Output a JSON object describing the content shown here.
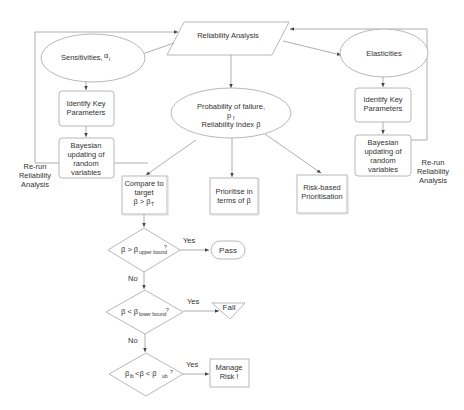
{
  "diagram": {
    "title_node": "Reliability Analysis",
    "left_branch": {
      "sensitivities": "Sensitivities,",
      "sensitivities_symbol": "α",
      "sensitivities_sub": "i",
      "identify_line1": "Identify Key",
      "identify_line2": "Parameters",
      "bayes_line1": "Bayesian",
      "bayes_line2": "updating of",
      "bayes_line3": "random",
      "bayes_line4": "variables",
      "rerun_line1": "Re-run",
      "rerun_line2": "Reliability",
      "rerun_line3": "Analysis"
    },
    "right_branch": {
      "elasticities": "Elasticities",
      "identify_line1": "Identify Key",
      "identify_line2": "Parameters",
      "bayes_line1": "Bayesian",
      "bayes_line2": "updating of",
      "bayes_line3": "random",
      "bayes_line4": "variables",
      "rerun_line1": "Re-run",
      "rerun_line2": "Reliability",
      "rerun_line3": "Analysis"
    },
    "center": {
      "pf_line1": "Probability of failure,",
      "pf_symbol": "p",
      "pf_sub": "f",
      "pf_line3": "Reliability Index  β"
    },
    "outputs": {
      "compare_line1": "Compare to",
      "compare_line2": "target",
      "compare_line3": "β > β",
      "compare_sub": "T",
      "prioritise_line1": "Prioritise in",
      "prioritise_line2": "terms of  β",
      "risk_line1": "Risk-based",
      "risk_line2": "Prioritisation"
    },
    "decisions": [
      {
        "text": "β > β",
        "sub": "upper bound",
        "q": "?",
        "yes": "Yes",
        "no": "No",
        "outcome": "Pass"
      },
      {
        "text": "β < β",
        "sub": "lower bound",
        "q": "?",
        "yes": "Yes",
        "no": "No",
        "outcome": "Fail"
      },
      {
        "pre": "β",
        "pre_sub": "lb",
        "text": "<β < β",
        "sub": "ub",
        "q": "?",
        "yes": "Yes",
        "outcome_line1": "Manage",
        "outcome_line2": "Risk !"
      }
    ]
  }
}
